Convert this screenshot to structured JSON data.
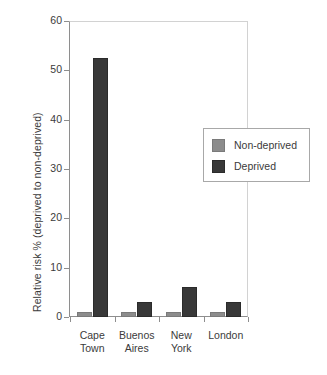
{
  "chart_data": {
    "type": "bar",
    "title": "",
    "xlabel": "",
    "ylabel": "Relative risk % (deprived to non-deprived)",
    "categories": [
      "Cape\nTown",
      "Buenos\nAires",
      "New\nYork",
      "London"
    ],
    "series": [
      {
        "name": "Non-deprived",
        "color": "#8c8c8c",
        "values": [
          1,
          1,
          1,
          1
        ]
      },
      {
        "name": "Deprived",
        "color": "#383838",
        "values": [
          52.5,
          3,
          6,
          3
        ]
      }
    ],
    "ylim": [
      0,
      60
    ],
    "yticks": [
      0,
      10,
      20,
      30,
      40,
      50,
      60
    ],
    "ytick_labels": [
      "0",
      "10",
      "20",
      "30",
      "40",
      "50",
      "60"
    ],
    "grid": false,
    "legend_position": "upper right (inside axes)"
  }
}
